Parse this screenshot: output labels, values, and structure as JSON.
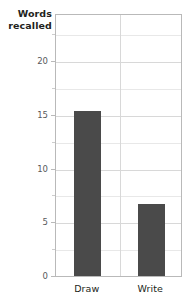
{
  "chart_data": {
    "type": "bar",
    "title": "",
    "xlabel": "",
    "ylabel": "Words recalled",
    "ylabel_lines": [
      "Words",
      "recalled"
    ],
    "categories": [
      "Draw",
      "Write"
    ],
    "values": [
      15.4,
      6.7
    ],
    "ylim": [
      0,
      24.5
    ],
    "yticks": [
      0,
      5,
      10,
      15,
      20
    ],
    "ytick_labels": [
      "0",
      "5",
      "10",
      "15",
      "20"
    ],
    "yminor_ticks": [
      2.5,
      7.5,
      12.5,
      17.5,
      22.5
    ],
    "grid": true,
    "grid_axis": "y",
    "legend": null,
    "bar_color": "#4a4a4a",
    "frame_color": "#b9b9b9",
    "grid_color": "#d8d8d8",
    "text_color": "#231f20",
    "tick_text_color": "#58595b"
  },
  "axes": {
    "y_title_line1": "Words",
    "y_title_line2": "recalled"
  },
  "labels": {
    "tick_0": "0",
    "tick_5": "5",
    "tick_10": "10",
    "tick_15": "15",
    "tick_20": "20",
    "cat_draw": "Draw",
    "cat_write": "Write"
  }
}
